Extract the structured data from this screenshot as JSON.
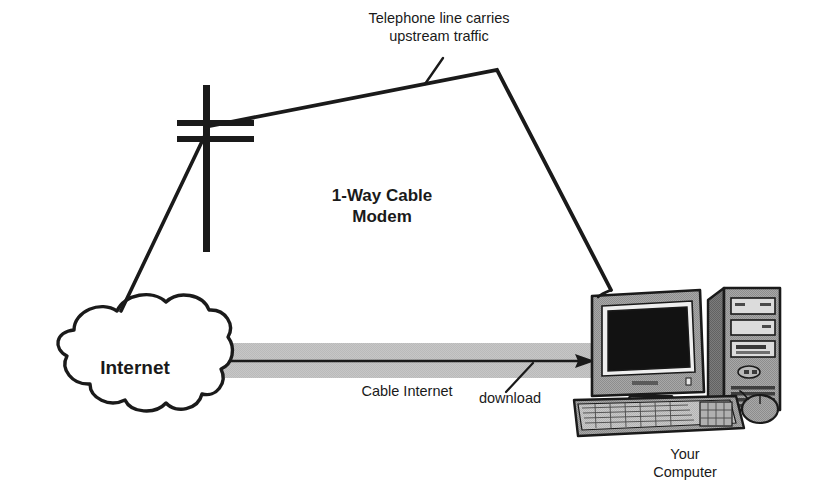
{
  "diagram": {
    "labels": {
      "upstream": "Telephone line carries\nupstream traffic",
      "modem": "1-Way Cable\nModem",
      "cloud": "Internet",
      "cable_internet": "Cable Internet",
      "download": "download",
      "your_computer": "Your\nComputer"
    },
    "colors": {
      "stroke": "#1a1a1a",
      "background": "#ffffff",
      "band_gray": "#bdbdbd",
      "case_gray": "#9a9a9a",
      "case_light": "#c4c4c4",
      "case_dark": "#6e6e6e",
      "screen_black": "#111111",
      "screen_frame": "#f2f2f2"
    },
    "nodes": [
      {
        "name": "internet-cloud",
        "label": "Internet"
      },
      {
        "name": "telephone-pole",
        "label": ""
      },
      {
        "name": "computer",
        "label": "Your Computer"
      }
    ],
    "connections": [
      {
        "name": "upstream-telephone-line",
        "from": "computer",
        "to": "telephone-pole",
        "label": "Telephone line carries upstream traffic",
        "direction": "upstream"
      },
      {
        "name": "pole-to-internet-line",
        "from": "telephone-pole",
        "to": "internet-cloud",
        "label": "",
        "direction": "upstream"
      },
      {
        "name": "downstream-cable-band",
        "from": "internet-cloud",
        "to": "computer",
        "label": "Cable Internet download",
        "direction": "downstream"
      }
    ]
  }
}
